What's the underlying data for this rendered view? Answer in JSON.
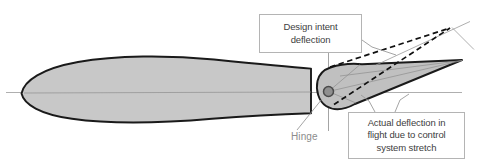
{
  "figure": {
    "background_color": "#ffffff",
    "body_fill": "#c8c8c8",
    "body_stroke": "#1a1a1a",
    "flap_fill": "#c0c0c0",
    "construction_line_color": "#9a9a9a",
    "dashed_line_color": "#111111",
    "pivot_fill": "#8f8f8f",
    "pivot_stroke": "#4a4a4a",
    "label_text_color": "#404040",
    "hinge_text_color": "#8c8c8c",
    "callout_border_color": "#b4b4b4"
  },
  "callouts": {
    "design_intent": {
      "lines": [
        "Design intent",
        "deflection"
      ],
      "line1": "Design intent",
      "line2": "deflection"
    },
    "actual_deflection": {
      "lines": [
        "Actual deflection in",
        "flight due to control",
        "system stretch"
      ],
      "line1": "Actual deflection in",
      "line2": "flight due to control",
      "line3": "system stretch"
    }
  },
  "annotations": {
    "hinge": "Hinge"
  }
}
